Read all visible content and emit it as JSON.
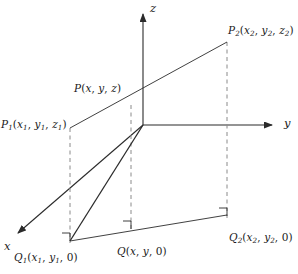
{
  "figure": {
    "background_color": "#ffffff",
    "line_color": "#2b2b2b",
    "dash_color": "#8a8a8a",
    "text_color": "#1a1a1a",
    "width": 298,
    "height": 274
  },
  "axes": {
    "origin": {
      "x": 143,
      "y": 125
    },
    "z": {
      "label": "z",
      "from": {
        "x": 143,
        "y": 125
      },
      "to": {
        "x": 143,
        "y": 10
      },
      "arrow": true
    },
    "y": {
      "label": "y",
      "from": {
        "x": 143,
        "y": 125
      },
      "to": {
        "x": 278,
        "y": 125
      },
      "arrow": true
    },
    "x": {
      "label": "x",
      "from": {
        "x": 143,
        "y": 125
      },
      "to": {
        "x": 13,
        "y": 237
      },
      "arrow": true
    }
  },
  "points": {
    "p1": {
      "name": "P",
      "sub": "1",
      "coords": "(x₁, y₁, z₁)",
      "label_parts": {
        "base": "P",
        "sub": "1",
        "open": "(",
        "x": "x",
        "xsub": "1",
        "c1": ", ",
        "y": "y",
        "ysub": "1",
        "c2": ", ",
        "z": "z",
        "zsub": "1",
        "close": ")"
      },
      "x": 70,
      "y": 128
    },
    "p": {
      "name": "P",
      "sub": "",
      "coords": "(x, y, z)",
      "label_parts": {
        "base": "P",
        "sub": "",
        "open": "(",
        "x": "x",
        "xsub": "",
        "c1": ", ",
        "y": "y",
        "ysub": "",
        "c2": ", ",
        "z": "z",
        "zsub": "",
        "close": ")"
      },
      "x": 131,
      "y": 105
    },
    "p2": {
      "name": "P",
      "sub": "2",
      "coords": "(x₂, y₂, z₂)",
      "label_parts": {
        "base": "P",
        "sub": "2",
        "open": "(",
        "x": "x",
        "xsub": "2",
        "c1": ", ",
        "y": "y",
        "ysub": "2",
        "c2": ", ",
        "z": "z",
        "zsub": "2",
        "close": ")"
      },
      "x": 227,
      "y": 42
    },
    "q1": {
      "name": "Q",
      "sub": "1",
      "coords": "(x₁, y₁, 0)",
      "label_parts": {
        "base": "Q",
        "sub": "1",
        "open": "(",
        "x": "x",
        "xsub": "1",
        "c1": ", ",
        "y": "y",
        "ysub": "1",
        "c2": ", ",
        "z": "0",
        "zsub": "",
        "close": ")"
      },
      "x": 70,
      "y": 240
    },
    "q": {
      "name": "Q",
      "sub": "",
      "coords": "(x, y, 0)",
      "label_parts": {
        "base": "Q",
        "sub": "",
        "open": "(",
        "x": "x",
        "xsub": "",
        "c1": ", ",
        "y": "y",
        "ysub": "",
        "c2": ", ",
        "z": "0",
        "zsub": "",
        "close": ")"
      },
      "x": 131,
      "y": 228
    },
    "q2": {
      "name": "Q",
      "sub": "2",
      "coords": "(x₂, y₂, 0)",
      "label_parts": {
        "base": "Q",
        "sub": "2",
        "open": "(",
        "x": "x",
        "xsub": "2",
        "c1": ", ",
        "y": "y",
        "ysub": "2",
        "c2": ", ",
        "z": "0",
        "zsub": "",
        "close": ")"
      },
      "x": 227,
      "y": 215
    }
  },
  "segments": {
    "upper_line": {
      "desc": "P1 to P2 through P",
      "from": "p1",
      "to": "p2",
      "style": "solid"
    },
    "base_line": {
      "desc": "Q1 to Q2 through Q",
      "from": "q1",
      "to": "q2",
      "style": "solid"
    },
    "diagonal_to_origin": {
      "desc": "Q1 up toward origin along x-axis direction",
      "from": "q1",
      "to": "origin",
      "style": "solid"
    },
    "drop_p1_q1": {
      "desc": "vertical dashed from P1 to Q1",
      "style": "dashed"
    },
    "drop_p_q": {
      "desc": "vertical dashed from P to Q",
      "style": "dashed"
    },
    "drop_p2_q2": {
      "desc": "vertical dashed from P2 to Q2",
      "style": "dashed"
    }
  },
  "right_angles": [
    {
      "at": "q1",
      "x": 70,
      "y": 240
    },
    {
      "at": "q",
      "x": 131,
      "y": 228
    },
    {
      "at": "q2",
      "x": 227,
      "y": 215
    }
  ]
}
